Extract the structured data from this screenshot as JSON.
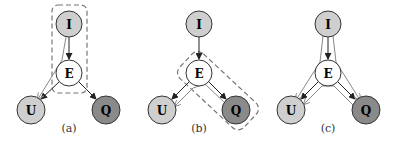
{
  "colors": {
    "observed_light": "#cfcfcf",
    "observed_dark": "#8a8a8a",
    "latent": "#ffffff",
    "edge": "#222222",
    "grad_edge": "#888888",
    "dashed": "#777777"
  },
  "panels": [
    {
      "caption": "(a)",
      "nodes": {
        "I": "I",
        "E": "E",
        "U": "U",
        "Q": "Q"
      }
    },
    {
      "caption": "(b)",
      "nodes": {
        "I": "I",
        "E": "E",
        "U": "U",
        "Q": "Q"
      }
    },
    {
      "caption": "(c)",
      "nodes": {
        "I": "I",
        "E": "E",
        "U": "U",
        "Q": "Q"
      }
    }
  ]
}
